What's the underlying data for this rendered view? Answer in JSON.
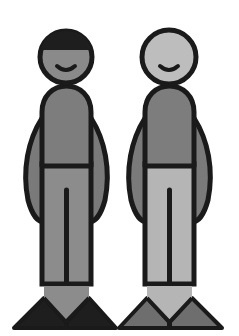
{
  "colors": {
    "background": "#ffffff",
    "outline": "#1a1a1a",
    "left_hair": "#1e1e1e",
    "left_face": "#8a8a8a",
    "right_face": "#bdbdbd",
    "torso": "#7d7d7d",
    "arm": "#7a7a7a",
    "left_legs": "#8c8c8c",
    "right_legs": "#b5b5b5",
    "left_feet": "#1e1e1e",
    "right_feet": "#6e6e6e"
  },
  "figures": [
    {
      "name": "left-figure",
      "description": "Figure with dark hair, smiling, darker trousers and black shoes"
    },
    {
      "name": "right-figure",
      "description": "Bald figure, smiling, lighter trousers and grey shoes"
    }
  ]
}
